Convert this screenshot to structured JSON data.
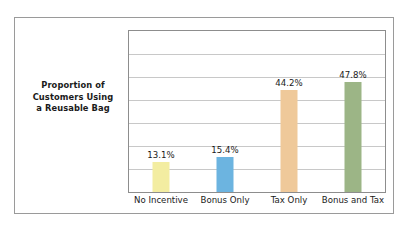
{
  "axis_title": {
    "lines": [
      "Proportion of",
      "Customers Using",
      "a Reusable Bag"
    ]
  },
  "chart_data": {
    "type": "bar",
    "title": "",
    "subtitle": "",
    "xlabel": "",
    "ylabel": "Proportion of Customers Using a Reusable Bag",
    "categories": [
      "No Incentive",
      "Bonus Only",
      "Tax Only",
      "Bonus and Tax"
    ],
    "values": [
      13.1,
      15.4,
      44.2,
      47.8
    ],
    "data_labels": [
      "13.1%",
      "15.4%",
      "44.2%",
      "47.8%"
    ],
    "bar_colors": [
      "#f3eda1",
      "#6cb4e0",
      "#efc99a",
      "#9cb586"
    ],
    "ylim": [
      0,
      70
    ],
    "ytick_labels": [],
    "gridlines": 6,
    "grid": true,
    "legend": false,
    "legend_position": "none",
    "units": "percent"
  }
}
